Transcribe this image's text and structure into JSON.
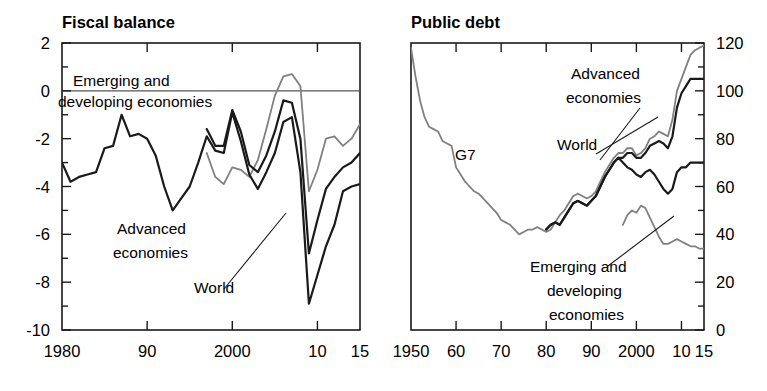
{
  "figure": {
    "background": "#ffffff",
    "ink": "#1a1a1a",
    "gray": "#808080"
  },
  "chart_data": [
    {
      "id": "fiscal-balance",
      "type": "line",
      "title": "Fiscal balance",
      "xlabel": "",
      "ylabel": "",
      "xlim": [
        1980,
        2015
      ],
      "ylim": [
        -10,
        2
      ],
      "ytick_labels": [
        "2",
        "0",
        "-2",
        "-4",
        "-6",
        "-8",
        "-10"
      ],
      "ytick_values": [
        2,
        0,
        -2,
        -4,
        -6,
        -8,
        -10
      ],
      "yminor_step": 1,
      "xtick_labels": [
        "1980",
        "90",
        "2000",
        "10",
        "15"
      ],
      "xtick_values": [
        1980,
        1990,
        2000,
        2010,
        2015
      ],
      "grid": false,
      "zero_line": 0,
      "y_axis_side": "left",
      "legend_position": "inline-annotations",
      "series": [
        {
          "name": "Emerging and developing economies",
          "color": "#808080",
          "width": 1.8,
          "x": [
            1997,
            1998,
            1999,
            2000,
            2001,
            2002,
            2003,
            2004,
            2005,
            2006,
            2007,
            2008,
            2009,
            2010,
            2011,
            2012,
            2013,
            2014,
            2015
          ],
          "values": [
            -2.6,
            -3.6,
            -3.9,
            -3.2,
            -3.3,
            -3.6,
            -2.9,
            -1.6,
            -0.2,
            0.6,
            0.7,
            0.2,
            -4.2,
            -3.3,
            -2.0,
            -1.9,
            -2.3,
            -2.0,
            -1.4
          ]
        },
        {
          "name": "World",
          "color": "#1a1a1a",
          "width": 2.2,
          "x": [
            1997,
            1998,
            1999,
            2000,
            2001,
            2002,
            2003,
            2004,
            2005,
            2006,
            2007,
            2008,
            2009,
            2010,
            2011,
            2012,
            2013,
            2014,
            2015
          ],
          "values": [
            -1.6,
            -2.3,
            -2.3,
            -0.8,
            -1.7,
            -3.1,
            -3.4,
            -2.7,
            -1.7,
            -0.4,
            -0.5,
            -2.0,
            -6.8,
            -5.4,
            -4.1,
            -3.6,
            -3.2,
            -3.0,
            -2.6
          ]
        },
        {
          "name": "Advanced economies",
          "color": "#1a1a1a",
          "width": 2.2,
          "x": [
            1980,
            1981,
            1982,
            1983,
            1984,
            1985,
            1986,
            1987,
            1988,
            1989,
            1990,
            1991,
            1992,
            1993,
            1994,
            1995,
            1996,
            1997,
            1998,
            1999,
            2000,
            2001,
            2002,
            2003,
            2004,
            2005,
            2006,
            2007,
            2008,
            2009,
            2010,
            2011,
            2012,
            2013,
            2014,
            2015
          ],
          "values": [
            -3.0,
            -3.8,
            -3.6,
            -3.5,
            -3.4,
            -2.4,
            -2.3,
            -1.0,
            -1.9,
            -1.8,
            -2.0,
            -2.7,
            -4.0,
            -5.0,
            -4.5,
            -4.0,
            -3.0,
            -1.9,
            -2.5,
            -2.6,
            -0.9,
            -2.1,
            -3.5,
            -4.1,
            -3.4,
            -2.6,
            -1.3,
            -1.1,
            -3.4,
            -8.9,
            -7.7,
            -6.5,
            -5.6,
            -4.2,
            -4.0,
            -3.9
          ]
        }
      ],
      "annotations": [
        {
          "text": "Emerging and",
          "x_px": 73,
          "y_px": 86
        },
        {
          "text": "developing economies",
          "x_px": 58,
          "y_px": 107
        },
        {
          "text": "Advanced",
          "x_px": 117,
          "y_px": 234
        },
        {
          "text": "economies",
          "x_px": 113,
          "y_px": 258
        },
        {
          "text": "World",
          "x_px": 194,
          "y_px": 293
        }
      ]
    },
    {
      "id": "public-debt",
      "type": "line",
      "title": "Public debt",
      "xlabel": "",
      "ylabel": "",
      "xlim": [
        1950,
        2015
      ],
      "ylim": [
        0,
        120
      ],
      "ytick_labels": [
        "120",
        "100",
        "80",
        "60",
        "40",
        "20",
        "0"
      ],
      "ytick_values": [
        120,
        100,
        80,
        60,
        40,
        20,
        0
      ],
      "yminor_step": 10,
      "xtick_labels": [
        "1950",
        "60",
        "70",
        "80",
        "90",
        "2000",
        "10",
        "15"
      ],
      "xtick_values": [
        1950,
        1960,
        1970,
        1980,
        1990,
        2000,
        2010,
        2015
      ],
      "grid": false,
      "y_axis_side": "right",
      "legend_position": "inline-annotations",
      "series": [
        {
          "name": "G7",
          "color": "#808080",
          "width": 1.8,
          "x": [
            1950,
            1951,
            1952,
            1953,
            1954,
            1955,
            1956,
            1957,
            1958,
            1959,
            1960,
            1961,
            1962,
            1963,
            1964,
            1965,
            1966,
            1967,
            1968,
            1969,
            1970,
            1971,
            1972,
            1973,
            1974,
            1975,
            1976,
            1977,
            1978,
            1979,
            1980,
            1981,
            1982,
            1983,
            1984,
            1985,
            1986,
            1987,
            1988,
            1989,
            1990,
            1991,
            1992,
            1993,
            1994,
            1995,
            1996,
            1997,
            1998,
            1999,
            2000,
            2001,
            2002,
            2003,
            2004,
            2005,
            2006,
            2007,
            2008,
            2009,
            2010,
            2011,
            2012,
            2013,
            2014,
            2015
          ],
          "values": [
            118,
            106,
            96,
            89,
            85,
            84,
            83,
            79,
            78,
            77,
            68,
            65,
            62,
            60,
            58,
            57,
            55,
            53,
            51,
            49,
            46,
            45,
            44,
            42,
            40,
            41,
            42,
            42,
            43,
            42,
            41,
            42,
            45,
            48,
            50,
            53,
            56,
            57,
            56,
            55,
            56,
            58,
            62,
            66,
            69,
            72,
            74,
            74,
            76,
            76,
            73,
            74,
            76,
            80,
            81,
            83,
            82,
            81,
            88,
            100,
            105,
            110,
            115,
            117,
            118,
            119
          ]
        },
        {
          "name": "Advanced economies",
          "color": "#1a1a1a",
          "width": 2.2,
          "x": [
            1980,
            1981,
            1982,
            1983,
            1984,
            1985,
            1986,
            1987,
            1988,
            1989,
            1990,
            1991,
            1992,
            1993,
            1994,
            1995,
            1996,
            1997,
            1998,
            1999,
            2000,
            2001,
            2002,
            2003,
            2004,
            2005,
            2006,
            2007,
            2008,
            2009,
            2010,
            2011,
            2012,
            2013,
            2014,
            2015
          ],
          "values": [
            42,
            44,
            45,
            44,
            47,
            50,
            53,
            54,
            53,
            52,
            54,
            56,
            60,
            64,
            67,
            70,
            72,
            72,
            74,
            74,
            72,
            72,
            74,
            77,
            78,
            79,
            78,
            76,
            81,
            93,
            99,
            102,
            105,
            105,
            105,
            105
          ]
        },
        {
          "name": "World",
          "color": "#1a1a1a",
          "width": 2.2,
          "x": [
            1980,
            1981,
            1982,
            1983,
            1984,
            1985,
            1986,
            1987,
            1988,
            1989,
            1990,
            1991,
            1992,
            1993,
            1994,
            1995,
            1996,
            1997,
            1998,
            1999,
            2000,
            2001,
            2002,
            2003,
            2004,
            2005,
            2006,
            2007,
            2008,
            2009,
            2010,
            2011,
            2012,
            2013,
            2014,
            2015
          ],
          "values": [
            42,
            44,
            45,
            44,
            47,
            50,
            53,
            54,
            53,
            52,
            54,
            56,
            60,
            64,
            67,
            70,
            72,
            70,
            68,
            67,
            65,
            64,
            66,
            67,
            65,
            62,
            59,
            57,
            59,
            66,
            68,
            68,
            70,
            70,
            70,
            70
          ]
        },
        {
          "name": "Emerging and developing economies",
          "color": "#808080",
          "width": 1.8,
          "x": [
            1997,
            1998,
            1999,
            2000,
            2001,
            2002,
            2003,
            2004,
            2005,
            2006,
            2007,
            2008,
            2009,
            2010,
            2011,
            2012,
            2013,
            2014,
            2015
          ],
          "values": [
            44,
            48,
            50,
            49,
            52,
            51,
            47,
            43,
            39,
            36,
            36,
            37,
            38,
            37,
            36,
            35,
            35,
            34,
            34
          ]
        }
      ],
      "annotations": [
        {
          "text": "G7",
          "x_px": 72,
          "y_px": 160
        },
        {
          "text": "Advanced",
          "x_px": 188,
          "y_px": 79
        },
        {
          "text": "economies",
          "x_px": 183,
          "y_px": 103
        },
        {
          "text": "World",
          "x_px": 174,
          "y_px": 150
        },
        {
          "text": "Emerging and",
          "x_px": 147,
          "y_px": 272
        },
        {
          "text": "developing",
          "x_px": 164,
          "y_px": 296
        },
        {
          "text": "economies",
          "x_px": 166,
          "y_px": 320
        }
      ]
    }
  ]
}
